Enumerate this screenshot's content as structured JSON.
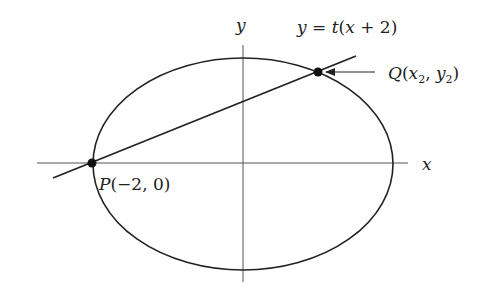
{
  "diagram": {
    "type": "ellipse-with-secant-line",
    "colors": {
      "stroke": "#222222",
      "axis": "#444444",
      "background": "#ffffff"
    },
    "axes": {
      "x_label": "x",
      "y_label": "y"
    },
    "ellipse": {
      "center_px": [
        243,
        164
      ],
      "rx_px": 150,
      "ry_px": 106
    },
    "line": {
      "equation": "y = t(x + 2)",
      "eq_parts": {
        "lhs": "y",
        "eq": " = ",
        "t": "t",
        "open": "(",
        "x": "x",
        "plus": " + ",
        "two": "2",
        "close": ")"
      }
    },
    "points": {
      "P": {
        "label": "P(−2, 0)",
        "name": "P",
        "open": "(",
        "coords": "−2, 0",
        "close": ")"
      },
      "Q": {
        "label": "Q(x2, y2)",
        "name": "Q",
        "open": "(",
        "x": "x",
        "x_sub": "2",
        "comma": ", ",
        "y": "y",
        "y_sub": "2",
        "close": ")"
      }
    }
  }
}
